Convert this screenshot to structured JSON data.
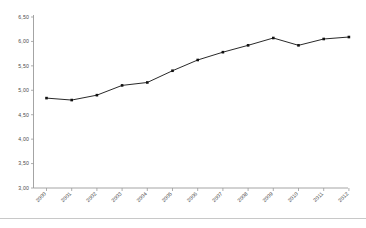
{
  "chart_data": {
    "type": "line",
    "title": "",
    "subtitle": "",
    "xlabel": "",
    "ylabel": "",
    "categories": [
      "2000",
      "2001",
      "2002",
      "2003",
      "2004",
      "2005",
      "2006",
      "2007",
      "2008",
      "2009",
      "2010",
      "2011",
      "2012"
    ],
    "values": [
      4.84,
      4.8,
      4.9,
      5.1,
      5.16,
      5.4,
      5.62,
      5.78,
      5.92,
      6.07,
      5.92,
      6.05,
      6.09
    ],
    "series": [
      {
        "name": "",
        "values": [
          4.84,
          4.8,
          4.9,
          5.1,
          5.16,
          5.4,
          5.62,
          5.78,
          5.92,
          6.07,
          5.92,
          6.05,
          6.09
        ]
      }
    ],
    "ylim": [
      3.0,
      6.5
    ],
    "ytick_values": [
      6.5,
      6.0,
      5.5,
      5.0,
      4.5,
      4.0,
      3.5,
      3.0
    ],
    "ytick_labels": [
      "6,50",
      "6,00",
      "5,50",
      "5,00",
      "4,50",
      "4,00",
      "3,50",
      "3,00"
    ],
    "xtick_labels": [
      "2000",
      "2001",
      "2002",
      "2003",
      "2004",
      "2005",
      "2006",
      "2007",
      "2008",
      "2009",
      "2010",
      "2011",
      "2012"
    ],
    "grid": false,
    "legend": "none",
    "marker": "square",
    "line_color": "#111111",
    "marker_color": "#111111",
    "axis_color": "#9a9a9a",
    "label_color": "#4a4a4a",
    "background_color": "#ffffff",
    "xtick_label_rotation": -45
  },
  "figure": {
    "footer_rule_color": "#c8c8c8"
  }
}
